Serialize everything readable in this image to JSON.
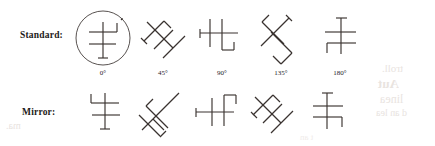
{
  "figure": {
    "rows": [
      {
        "id": "standard",
        "label": "Standard:",
        "items": [
          {
            "name": "standard-0",
            "angle_label": "0",
            "degree": "°",
            "circled": true
          },
          {
            "name": "standard-45",
            "angle_label": "45",
            "degree": "°",
            "circled": false
          },
          {
            "name": "standard-90",
            "angle_label": "90",
            "degree": "°",
            "circled": false
          },
          {
            "name": "standard-135",
            "angle_label": "135",
            "degree": "°",
            "circled": false
          },
          {
            "name": "standard-180",
            "angle_label": "180",
            "degree": "°",
            "circled": false
          }
        ]
      },
      {
        "id": "mirror",
        "label": "Mirror:",
        "items": [
          {
            "name": "mirror-0",
            "circled": false
          },
          {
            "name": "mirror-45",
            "circled": false
          },
          {
            "name": "mirror-90",
            "circled": false
          },
          {
            "name": "mirror-135",
            "circled": false
          },
          {
            "name": "mirror-180",
            "circled": false
          }
        ]
      }
    ],
    "angle_labels": [
      "0°",
      "45°",
      "90°",
      "135°",
      "180°"
    ],
    "stroke_color": "#3a3330",
    "background_color": "#ffffff"
  },
  "bleed_through": {
    "line1": "troll.",
    "line2": "Aut",
    "line3": "linea",
    "line4": "d an lea",
    "line5": "ma.",
    "line6": "t an"
  }
}
